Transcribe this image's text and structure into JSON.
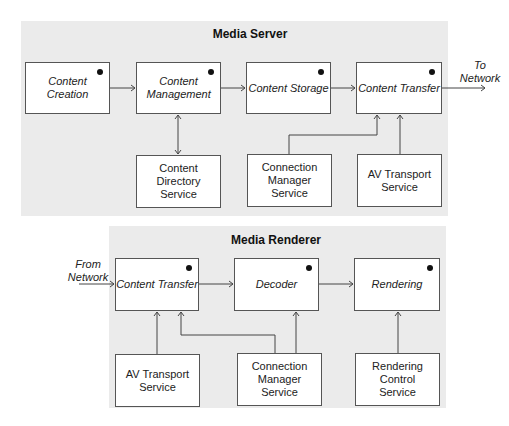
{
  "media_server": {
    "title": "Media Server",
    "components": [
      {
        "id": "content-creation",
        "label": "Content Creation"
      },
      {
        "id": "content-management",
        "label": "Content Management"
      },
      {
        "id": "content-storage",
        "label": "Content Storage"
      },
      {
        "id": "content-transfer",
        "label": "Content Transfer"
      }
    ],
    "services": [
      {
        "id": "content-directory-service",
        "label": "Content Directory Service"
      },
      {
        "id": "connection-manager-service",
        "label": "Connection Manager Service"
      },
      {
        "id": "av-transport-service",
        "label": "AV Transport Service"
      }
    ],
    "output_label": "To Network"
  },
  "media_renderer": {
    "title": "Media Renderer",
    "input_label": "From Network",
    "components": [
      {
        "id": "content-transfer",
        "label": "Content Transfer"
      },
      {
        "id": "decoder",
        "label": "Decoder"
      },
      {
        "id": "rendering",
        "label": "Rendering"
      }
    ],
    "services": [
      {
        "id": "av-transport-service",
        "label": "AV Transport Service"
      },
      {
        "id": "connection-manager-service",
        "label": "Connection Manager Service"
      },
      {
        "id": "rendering-control-service",
        "label": "Rendering Control Service"
      }
    ]
  },
  "edges": [
    {
      "from": "server.content-creation",
      "to": "server.content-management",
      "type": "arrow"
    },
    {
      "from": "server.content-management",
      "to": "server.content-storage",
      "type": "arrow"
    },
    {
      "from": "server.content-storage",
      "to": "server.content-transfer",
      "type": "arrow"
    },
    {
      "from": "server.content-transfer",
      "to": "To Network",
      "type": "arrow"
    },
    {
      "from": "server.content-management",
      "to": "server.content-directory-service",
      "type": "bidirectional"
    },
    {
      "from": "server.connection-manager-service",
      "to": "server.content-transfer",
      "type": "arrow"
    },
    {
      "from": "server.av-transport-service",
      "to": "server.content-transfer",
      "type": "arrow"
    },
    {
      "from": "From Network",
      "to": "renderer.content-transfer",
      "type": "arrow"
    },
    {
      "from": "renderer.content-transfer",
      "to": "renderer.decoder",
      "type": "arrow"
    },
    {
      "from": "renderer.decoder",
      "to": "renderer.rendering",
      "type": "arrow"
    },
    {
      "from": "renderer.av-transport-service",
      "to": "renderer.content-transfer",
      "type": "arrow"
    },
    {
      "from": "renderer.connection-manager-service",
      "to": "renderer.content-transfer",
      "type": "arrow"
    },
    {
      "from": "renderer.connection-manager-service",
      "to": "renderer.decoder",
      "type": "arrow"
    },
    {
      "from": "renderer.rendering-control-service",
      "to": "renderer.rendering",
      "type": "arrow"
    }
  ]
}
